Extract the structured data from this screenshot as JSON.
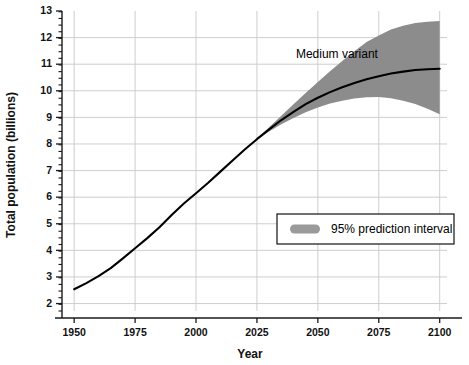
{
  "chart_data": {
    "type": "line",
    "title": "",
    "xlabel": "Year",
    "ylabel": "Total population (billions)",
    "xlim": [
      1945,
      2103
    ],
    "ylim": [
      1.72,
      13.0
    ],
    "grid": true,
    "x_ticks": [
      1950,
      1975,
      2000,
      2025,
      2050,
      2075,
      2100
    ],
    "x_tick_labels": [
      "1950",
      "1975",
      "2000",
      "2025",
      "2050",
      "2075",
      "2100"
    ],
    "y_ticks": [
      2,
      3,
      4,
      5,
      6,
      7,
      8,
      9,
      10,
      11,
      12,
      13
    ],
    "y_tick_labels": [
      "2",
      "3",
      "4",
      "5",
      "6",
      "7",
      "8",
      "9",
      "10",
      "11",
      "12",
      "13"
    ],
    "y_minor_step": 0.25,
    "series": [
      {
        "name": "Medium variant",
        "kind": "line",
        "color": "#000000",
        "x": [
          1950,
          1955,
          1960,
          1965,
          1970,
          1975,
          1980,
          1985,
          1990,
          1995,
          2000,
          2005,
          2010,
          2015,
          2020,
          2025,
          2030,
          2035,
          2040,
          2045,
          2050,
          2055,
          2060,
          2065,
          2070,
          2075,
          2080,
          2085,
          2090,
          2095,
          2100
        ],
        "y": [
          2.54,
          2.77,
          3.03,
          3.33,
          3.7,
          4.08,
          4.46,
          4.87,
          5.33,
          5.76,
          6.15,
          6.54,
          6.96,
          7.38,
          7.79,
          8.18,
          8.55,
          8.9,
          9.21,
          9.5,
          9.74,
          9.95,
          10.13,
          10.29,
          10.43,
          10.55,
          10.65,
          10.72,
          10.78,
          10.81,
          10.83
        ]
      },
      {
        "name": "95% prediction interval",
        "kind": "band",
        "color": "#8c8c8c",
        "x": [
          2025,
          2030,
          2035,
          2040,
          2045,
          2050,
          2055,
          2060,
          2065,
          2070,
          2075,
          2080,
          2085,
          2090,
          2095,
          2100
        ],
        "y_upper": [
          8.2,
          8.63,
          9.06,
          9.49,
          9.92,
          10.33,
          10.73,
          11.12,
          11.49,
          11.83,
          12.08,
          12.3,
          12.45,
          12.55,
          12.6,
          12.62
        ],
        "y_lower": [
          8.16,
          8.47,
          8.74,
          8.98,
          9.19,
          9.37,
          9.52,
          9.63,
          9.71,
          9.76,
          9.77,
          9.72,
          9.63,
          9.5,
          9.32,
          9.12
        ]
      }
    ],
    "annotations": [
      {
        "name": "medium-variant-label",
        "text": "Medium variant",
        "x": 2041,
        "y": 11.25
      }
    ],
    "legend": {
      "position": "inside-lower-right",
      "entries": [
        {
          "label": "95% prediction interval",
          "swatch_color": "#9a9a9a",
          "swatch_type": "patch"
        }
      ]
    }
  }
}
